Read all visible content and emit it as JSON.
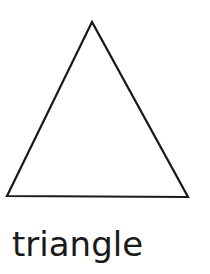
{
  "figure": {
    "shape": {
      "type": "triangle",
      "vertices": [
        [
          92,
          22
        ],
        [
          7,
          196
        ],
        [
          188,
          197
        ]
      ],
      "stroke_color": "#1a1a1a",
      "stroke_width": 2.2,
      "fill": "#ffffff"
    },
    "label": "triangle"
  }
}
